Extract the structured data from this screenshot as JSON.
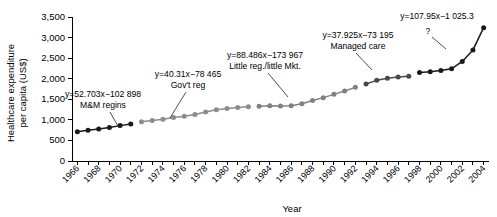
{
  "chart_data": {
    "type": "line",
    "title": "",
    "xlabel": "Year",
    "ylabel": "Healthcare expenditure per capita (US$)",
    "ylim": [
      0,
      3500
    ],
    "ytick_values": [
      0,
      500,
      1000,
      1500,
      2000,
      2500,
      3000,
      3500
    ],
    "ytick_labels": [
      "0",
      "500",
      "1,000",
      "1,500",
      "2,000",
      "2,500",
      "3,000",
      "3,500"
    ],
    "xlim": [
      1965.5,
      2004.5
    ],
    "xtick_labels": [
      "1966",
      "1968",
      "1970",
      "1972",
      "1974",
      "1976",
      "1978",
      "1980",
      "1982",
      "1984",
      "1986",
      "1988",
      "1990",
      "1992",
      "1994",
      "1996",
      "1998",
      "2000",
      "2002",
      "2004"
    ],
    "xtick_values": [
      1966,
      1968,
      1970,
      1972,
      1974,
      1976,
      1978,
      1980,
      1982,
      1984,
      1986,
      1988,
      1990,
      1992,
      1994,
      1996,
      1998,
      2000,
      2002,
      2004
    ],
    "grid": false,
    "legend": null,
    "x": [
      1966,
      1967,
      1968,
      1969,
      1970,
      1971,
      1972,
      1973,
      1974,
      1975,
      1976,
      1977,
      1978,
      1979,
      1980,
      1981,
      1982,
      1983,
      1984,
      1985,
      1986,
      1987,
      1988,
      1989,
      1990,
      1991,
      1992,
      1993,
      1994,
      1995,
      1996,
      1997,
      1998,
      1999,
      2000,
      2001,
      2002,
      2003,
      2004
    ],
    "y": [
      710,
      745,
      780,
      815,
      860,
      900,
      955,
      985,
      1015,
      1055,
      1090,
      1130,
      1190,
      1245,
      1275,
      1300,
      1320,
      1330,
      1340,
      1335,
      1345,
      1390,
      1470,
      1540,
      1620,
      1700,
      1790,
      1870,
      1960,
      2010,
      2040,
      2060,
      2150,
      2170,
      2200,
      2240,
      2420,
      2700,
      3240
    ],
    "series": [
      {
        "name": "M&M regins",
        "color": "#1a1a1a",
        "equation": "y=52.703x−102 898",
        "x": [
          1966,
          1967,
          1968,
          1969,
          1970,
          1971
        ],
        "values": [
          710,
          745,
          780,
          815,
          860,
          900
        ]
      },
      {
        "name": "Gov't reg",
        "color": "#8c8c8c",
        "equation": "y=40.31x−78 465",
        "x": [
          1972,
          1973,
          1974,
          1975,
          1976,
          1977,
          1978,
          1979,
          1980,
          1981,
          1982
        ],
        "values": [
          955,
          985,
          1015,
          1055,
          1090,
          1130,
          1190,
          1245,
          1275,
          1300,
          1320
        ]
      },
      {
        "name": "Little reg./little Mkt.",
        "color": "#808080",
        "equation": "y=88.486x−173 967",
        "x": [
          1983,
          1984,
          1985,
          1986,
          1987,
          1988,
          1989,
          1990,
          1991,
          1992
        ],
        "values": [
          1330,
          1340,
          1335,
          1345,
          1390,
          1470,
          1540,
          1620,
          1700,
          1790
        ]
      },
      {
        "name": "Managed care",
        "color": "#4a4a4a",
        "equation": "y=37.925x−73 195",
        "x": [
          1993,
          1994,
          1995,
          1996,
          1997
        ],
        "values": [
          1870,
          1960,
          2010,
          2040,
          2060
        ]
      },
      {
        "name": "?",
        "color": "#1a1a1a",
        "equation": "y=107.95x−1 025.3",
        "x": [
          1998,
          1999,
          2000,
          2001,
          2002,
          2003,
          2004
        ],
        "values": [
          2150,
          2170,
          2200,
          2240,
          2420,
          2700,
          3240
        ]
      }
    ],
    "annotations": [
      {
        "equation": "y=52.703x−102 898",
        "label": "M&M regins"
      },
      {
        "equation": "y=40.31x−78 465",
        "label": "Gov't reg"
      },
      {
        "equation": "y=88.486x−173 967",
        "label": "Little reg./little Mkt."
      },
      {
        "equation": "y=37.925x−73 195",
        "label": "Managed care"
      },
      {
        "equation": "y=107.95x−1 025.3",
        "label": "?"
      }
    ]
  }
}
